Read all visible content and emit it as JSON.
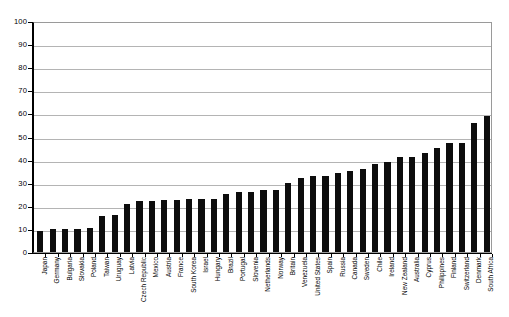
{
  "chart_data": {
    "type": "bar",
    "title": "",
    "subtitle": "",
    "xlabel": "",
    "ylabel": "",
    "ylim": [
      0,
      100
    ],
    "ytick_interval": 10,
    "grid": true,
    "legend": false,
    "legend_position": "none",
    "orientation": "vertical",
    "bar_color": "#0d0d0d",
    "bar_label_rotation": -90,
    "yticks": [
      0,
      10,
      20,
      30,
      40,
      50,
      60,
      70,
      80,
      90,
      100
    ],
    "ytick_labels": [
      "0",
      "10",
      "20",
      "30",
      "40",
      "50",
      "60",
      "70",
      "80",
      "90",
      "100"
    ],
    "categories": [
      "Japan",
      "Germany",
      "Bulgaria",
      "Slovakia",
      "Poland",
      "Taiwan",
      "Uruguay",
      "Latvia",
      "Czech Republic",
      "Mexico",
      "Austria",
      "France",
      "South Korea",
      "Israel",
      "Hungary",
      "Brazil",
      "Portugal",
      "Slovenia",
      "Netherlands",
      "Norway",
      "Britain",
      "Venezuela",
      "United States",
      "Spain",
      "Russia",
      "Canada",
      "Sweden",
      "Chile",
      "Ireland",
      "New Zealand",
      "Australia",
      "Cyprus",
      "Philippines",
      "Finland",
      "Switzerland",
      "Denmark",
      "South Africa"
    ],
    "values": [
      9,
      10,
      10,
      10,
      10.5,
      15.5,
      16,
      21,
      22,
      22,
      22.5,
      22.5,
      23,
      23,
      23,
      25,
      26,
      26,
      27,
      27,
      30,
      32,
      33,
      33,
      34,
      35,
      36,
      38,
      39,
      41,
      41,
      43,
      45,
      47,
      47,
      56,
      59
    ]
  }
}
